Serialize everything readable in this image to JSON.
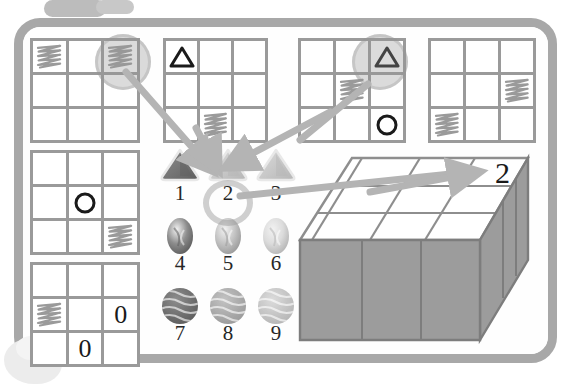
{
  "app": {
    "title": "Visual Reasoning Puzzle Board",
    "frame_color": "#a8a8a8",
    "board_background": "#fefefe",
    "ink_color": "#1a1a1a",
    "grid_line_color": "#9a9a9a",
    "highlight_color": "#969696"
  },
  "top_tab": {
    "name": "board-tab",
    "label": ""
  },
  "grids": [
    {
      "id": "grid-1",
      "name": "pattern-grid-1",
      "cells": [
        {
          "r": 0,
          "c": 0,
          "content": "scribble"
        },
        {
          "r": 0,
          "c": 1,
          "content": "empty"
        },
        {
          "r": 0,
          "c": 2,
          "content": "scribble"
        },
        {
          "r": 1,
          "c": 0,
          "content": "empty"
        },
        {
          "r": 1,
          "c": 1,
          "content": "empty"
        },
        {
          "r": 1,
          "c": 2,
          "content": "empty"
        },
        {
          "r": 2,
          "c": 0,
          "content": "empty"
        },
        {
          "r": 2,
          "c": 1,
          "content": "empty"
        },
        {
          "r": 2,
          "c": 2,
          "content": "empty"
        }
      ],
      "highlighted_cell": {
        "r": 0,
        "c": 2
      }
    },
    {
      "id": "grid-2",
      "name": "pattern-grid-2",
      "cells": [
        {
          "r": 0,
          "c": 0,
          "content": "triangle"
        },
        {
          "r": 0,
          "c": 1,
          "content": "empty"
        },
        {
          "r": 0,
          "c": 2,
          "content": "empty"
        },
        {
          "r": 1,
          "c": 0,
          "content": "empty"
        },
        {
          "r": 1,
          "c": 1,
          "content": "empty"
        },
        {
          "r": 1,
          "c": 2,
          "content": "empty"
        },
        {
          "r": 2,
          "c": 0,
          "content": "empty"
        },
        {
          "r": 2,
          "c": 1,
          "content": "scribble"
        },
        {
          "r": 2,
          "c": 2,
          "content": "empty"
        }
      ],
      "highlighted_cell": null
    },
    {
      "id": "grid-3",
      "name": "pattern-grid-3",
      "cells": [
        {
          "r": 0,
          "c": 0,
          "content": "empty"
        },
        {
          "r": 0,
          "c": 1,
          "content": "empty"
        },
        {
          "r": 0,
          "c": 2,
          "content": "triangle"
        },
        {
          "r": 1,
          "c": 0,
          "content": "empty"
        },
        {
          "r": 1,
          "c": 1,
          "content": "scribble"
        },
        {
          "r": 1,
          "c": 2,
          "content": "empty"
        },
        {
          "r": 2,
          "c": 0,
          "content": "empty"
        },
        {
          "r": 2,
          "c": 1,
          "content": "empty"
        },
        {
          "r": 2,
          "c": 2,
          "content": "circle"
        }
      ],
      "highlighted_cell": {
        "r": 0,
        "c": 2
      }
    },
    {
      "id": "grid-4",
      "name": "pattern-grid-4",
      "cells": [
        {
          "r": 0,
          "c": 0,
          "content": "empty"
        },
        {
          "r": 0,
          "c": 1,
          "content": "empty"
        },
        {
          "r": 0,
          "c": 2,
          "content": "empty"
        },
        {
          "r": 1,
          "c": 0,
          "content": "empty"
        },
        {
          "r": 1,
          "c": 1,
          "content": "empty"
        },
        {
          "r": 1,
          "c": 2,
          "content": "scribble"
        },
        {
          "r": 2,
          "c": 0,
          "content": "scribble"
        },
        {
          "r": 2,
          "c": 1,
          "content": "empty"
        },
        {
          "r": 2,
          "c": 2,
          "content": "empty"
        }
      ],
      "highlighted_cell": null
    },
    {
      "id": "grid-5",
      "name": "pattern-grid-5",
      "cells": [
        {
          "r": 0,
          "c": 0,
          "content": "empty"
        },
        {
          "r": 0,
          "c": 1,
          "content": "empty"
        },
        {
          "r": 0,
          "c": 2,
          "content": "empty"
        },
        {
          "r": 1,
          "c": 0,
          "content": "empty"
        },
        {
          "r": 1,
          "c": 1,
          "content": "circle"
        },
        {
          "r": 1,
          "c": 2,
          "content": "empty"
        },
        {
          "r": 2,
          "c": 0,
          "content": "empty"
        },
        {
          "r": 2,
          "c": 1,
          "content": "empty"
        },
        {
          "r": 2,
          "c": 2,
          "content": "scribble"
        }
      ],
      "highlighted_cell": null
    },
    {
      "id": "grid-6",
      "name": "pattern-grid-6",
      "cells": [
        {
          "r": 0,
          "c": 0,
          "content": "empty"
        },
        {
          "r": 0,
          "c": 1,
          "content": "empty"
        },
        {
          "r": 0,
          "c": 2,
          "content": "empty"
        },
        {
          "r": 1,
          "c": 0,
          "content": "scribble"
        },
        {
          "r": 1,
          "c": 1,
          "content": "empty"
        },
        {
          "r": 1,
          "c": 2,
          "content": "zero"
        },
        {
          "r": 2,
          "c": 0,
          "content": "empty"
        },
        {
          "r": 2,
          "c": 1,
          "content": "zero"
        },
        {
          "r": 2,
          "c": 2,
          "content": "empty"
        }
      ],
      "highlighted_cell": null
    }
  ],
  "palette": {
    "name": "answer-options",
    "selected": "2",
    "options": [
      {
        "label": "1",
        "shape": "triangle",
        "tone": "dark"
      },
      {
        "label": "2",
        "shape": "triangle",
        "tone": "light"
      },
      {
        "label": "3",
        "shape": "triangle",
        "tone": "light"
      },
      {
        "label": "4",
        "shape": "oval",
        "tone": "dark"
      },
      {
        "label": "5",
        "shape": "oval",
        "tone": "medium"
      },
      {
        "label": "6",
        "shape": "oval",
        "tone": "light"
      },
      {
        "label": "7",
        "shape": "circle",
        "tone": "dark"
      },
      {
        "label": "8",
        "shape": "circle",
        "tone": "medium"
      },
      {
        "label": "9",
        "shape": "circle",
        "tone": "light"
      }
    ]
  },
  "isometric_box": {
    "name": "isometric-answer-box",
    "rows": 3,
    "columns": 3,
    "number_label": "2",
    "top_face_color": "#ffffff",
    "side_face_color": "#9c9c9c"
  },
  "annotations": {
    "arrow_color": "#b4b4b4",
    "arrows": [
      {
        "from": "grid-1 highlighted cell",
        "to": "option 2"
      },
      {
        "from": "grid-2 scribble cell",
        "to": "option 2"
      },
      {
        "from": "grid-3 highlighted triangle",
        "to": "option 2"
      },
      {
        "from": "option 2",
        "to": "isometric box cell 2"
      }
    ]
  }
}
